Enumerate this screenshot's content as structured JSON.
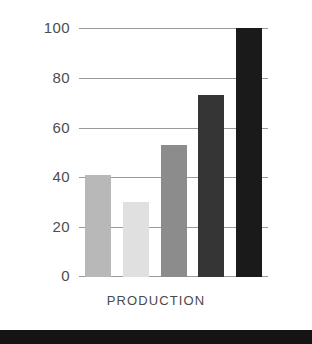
{
  "chart_data": {
    "type": "bar",
    "title": "",
    "subtitle": "",
    "xlabel": "PRODUCTION",
    "ylabel": "",
    "categories": [
      "1",
      "2",
      "3",
      "4",
      "5"
    ],
    "values": [
      41,
      30,
      53,
      73,
      100
    ],
    "bar_colors": [
      "#b8b8b8",
      "#e0e0e0",
      "#8c8c8c",
      "#353535",
      "#1a1a1a"
    ],
    "ylim": [
      0,
      100
    ],
    "yticks": [
      0,
      20,
      40,
      60,
      80,
      100
    ],
    "ytick_labels": [
      "0",
      "20",
      "40",
      "60",
      "80",
      "100"
    ],
    "grid": true,
    "grid_axis": "y",
    "legend": false,
    "legend_position": "none",
    "annotations": []
  },
  "colors": {
    "background": "#ffffff",
    "gridline": "#9a9a9a",
    "tick_text": "#4d4d4d",
    "axis_label_text": "#4a4a4a",
    "bottom_band": "#141414"
  },
  "tick_0": "0",
  "tick_20": "20",
  "tick_40": "40",
  "tick_60": "60",
  "tick_80": "80",
  "tick_100": "100"
}
